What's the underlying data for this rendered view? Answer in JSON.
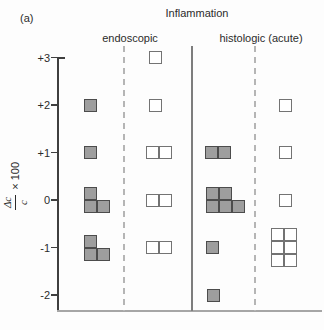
{
  "figure": {
    "panel_label": "(a)",
    "title": "Inflammation",
    "group_headers": [
      {
        "label": "endoscopic"
      },
      {
        "label": "histologic (acute)"
      }
    ],
    "y_axis": {
      "label_numerator": "Δc",
      "label_denominator": "c",
      "label_suffix": "× 100",
      "tick_labels": [
        "+3",
        "+2",
        "+1",
        "0",
        "-1",
        "-2"
      ]
    }
  },
  "colors": {
    "filled_square_fill": "#9e9e9e",
    "filled_square_border": "#4c4c4c",
    "open_square_fill": "#ffffff",
    "open_square_border": "#737373",
    "axis": "#3f3f3f",
    "separator_solid": "#7d7d7d",
    "separator_dashed": "#b5b5b5",
    "baseline": "#a6a6a6",
    "text": "#2b2b2b",
    "background": "#fdfdfd"
  },
  "chart_data": {
    "type": "scatter",
    "marker": "square",
    "title": "Inflammation",
    "ylabel": "Δc/c × 100",
    "yticks": [
      3,
      2,
      1,
      0,
      -1,
      -2
    ],
    "ylim": [
      -2.5,
      3.2
    ],
    "grid": false,
    "groups": [
      {
        "header": "endoscopic",
        "columns": [
          {
            "style": "filled",
            "counts": [
              {
                "value": 2,
                "count": 1
              },
              {
                "value": 1,
                "count": 1
              },
              {
                "value": 0,
                "count": 3
              },
              {
                "value": -1,
                "count": 3
              }
            ]
          },
          {
            "style": "open",
            "counts": [
              {
                "value": 3,
                "count": 1
              },
              {
                "value": 2,
                "count": 1
              },
              {
                "value": 1,
                "count": 2
              },
              {
                "value": 0,
                "count": 2
              },
              {
                "value": -1,
                "count": 2
              }
            ]
          }
        ]
      },
      {
        "header": "histologic (acute)",
        "columns": [
          {
            "style": "filled",
            "counts": [
              {
                "value": 1,
                "count": 2
              },
              {
                "value": 0,
                "count": 5
              },
              {
                "value": -1,
                "count": 1
              },
              {
                "value": -2,
                "count": 1
              }
            ]
          },
          {
            "style": "open",
            "counts": [
              {
                "value": 2,
                "count": 1
              },
              {
                "value": 1,
                "count": 1
              },
              {
                "value": 0,
                "count": 1
              },
              {
                "value": -1,
                "count": 6
              }
            ]
          }
        ]
      }
    ],
    "markers": [
      {
        "x": 90,
        "y": 105,
        "style": "filled"
      },
      {
        "x": 90,
        "y": 152.5,
        "style": "filled"
      },
      {
        "x": 90,
        "y": 193.5,
        "style": "filled"
      },
      {
        "x": 90,
        "y": 206.5,
        "style": "filled"
      },
      {
        "x": 103,
        "y": 206.5,
        "style": "filled"
      },
      {
        "x": 90,
        "y": 241,
        "style": "filled"
      },
      {
        "x": 90,
        "y": 254,
        "style": "filled"
      },
      {
        "x": 103,
        "y": 254,
        "style": "filled"
      },
      {
        "x": 211,
        "y": 152.5,
        "style": "filled"
      },
      {
        "x": 224,
        "y": 152.5,
        "style": "filled"
      },
      {
        "x": 212,
        "y": 193.5,
        "style": "filled"
      },
      {
        "x": 225,
        "y": 193.5,
        "style": "filled"
      },
      {
        "x": 212,
        "y": 206.5,
        "style": "filled"
      },
      {
        "x": 225,
        "y": 206.5,
        "style": "filled"
      },
      {
        "x": 238,
        "y": 206.5,
        "style": "filled"
      },
      {
        "x": 212,
        "y": 247.5,
        "style": "filled"
      },
      {
        "x": 213,
        "y": 295,
        "style": "filled"
      },
      {
        "x": 155,
        "y": 57.5,
        "style": "open"
      },
      {
        "x": 155,
        "y": 105,
        "style": "open"
      },
      {
        "x": 152,
        "y": 152.5,
        "style": "open"
      },
      {
        "x": 165,
        "y": 152.5,
        "style": "open"
      },
      {
        "x": 152,
        "y": 200,
        "style": "open"
      },
      {
        "x": 165,
        "y": 200,
        "style": "open"
      },
      {
        "x": 152,
        "y": 247.5,
        "style": "open"
      },
      {
        "x": 165,
        "y": 247.5,
        "style": "open"
      },
      {
        "x": 285,
        "y": 105,
        "style": "open"
      },
      {
        "x": 285,
        "y": 152.5,
        "style": "open"
      },
      {
        "x": 285,
        "y": 200,
        "style": "open"
      },
      {
        "x": 277,
        "y": 234.5,
        "style": "open"
      },
      {
        "x": 290,
        "y": 234.5,
        "style": "open"
      },
      {
        "x": 277,
        "y": 247.5,
        "style": "open"
      },
      {
        "x": 290,
        "y": 247.5,
        "style": "open"
      },
      {
        "x": 277,
        "y": 260.5,
        "style": "open"
      },
      {
        "x": 290,
        "y": 260.5,
        "style": "open"
      }
    ]
  }
}
